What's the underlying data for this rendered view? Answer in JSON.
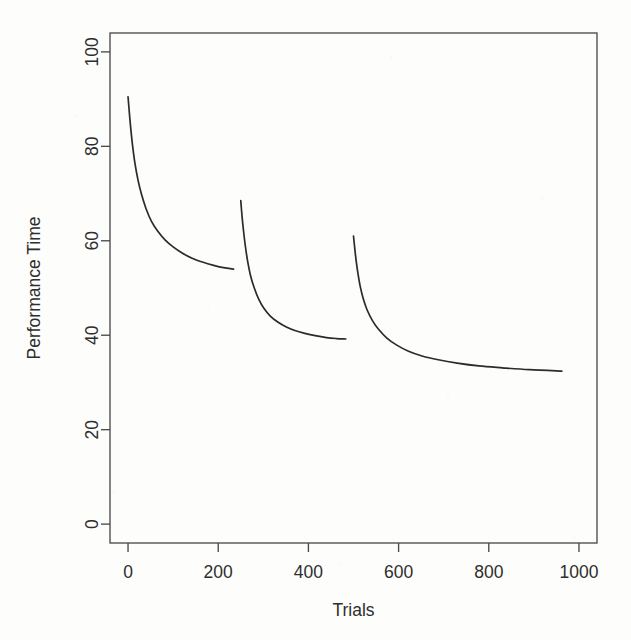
{
  "figure": {
    "kind": "line-plot",
    "background_color": "#fdfdfc",
    "line_color": "#2b2b2b",
    "axis_color": "#4a4a4a",
    "text_color": "#2e2e2e",
    "plot_box": {
      "left": 110,
      "top": 33,
      "right": 597,
      "bottom": 543
    }
  },
  "chart_data": {
    "type": "line",
    "title": "",
    "subtitle": "",
    "xlabel": "Trials",
    "ylabel": "Performance Time",
    "xlim": [
      -40,
      1040
    ],
    "ylim": [
      -4,
      104
    ],
    "xticks": [
      0,
      200,
      400,
      600,
      800,
      1000
    ],
    "xtick_labels": [
      "0",
      "200",
      "400",
      "600",
      "800",
      "1000"
    ],
    "yticks": [
      0,
      20,
      40,
      60,
      80,
      100
    ],
    "ytick_labels": [
      "0",
      "20",
      "40",
      "60",
      "80",
      "100"
    ],
    "grid": false,
    "legend": null,
    "legend_position": "none",
    "annotations": [],
    "ylabel_rotation_deg": -90,
    "ytick_label_rotation_deg": -90,
    "series": [
      {
        "name": "Practice block 1",
        "x": [
          0,
          3,
          6,
          10,
          15,
          22,
          30,
          40,
          52,
          66,
          82,
          100,
          120,
          142,
          165,
          190,
          212,
          234
        ],
        "y": [
          90.5,
          87.0,
          83.8,
          80.2,
          76.6,
          72.9,
          69.8,
          66.8,
          64.1,
          62.0,
          60.2,
          58.7,
          57.4,
          56.3,
          55.5,
          54.8,
          54.3,
          54.0
        ]
      },
      {
        "name": "Practice block 2",
        "x": [
          250,
          253,
          256,
          260,
          265,
          272,
          280,
          290,
          302,
          316,
          332,
          350,
          370,
          392,
          415,
          440,
          462,
          483
        ],
        "y": [
          68.5,
          65.0,
          62.2,
          59.0,
          55.8,
          52.5,
          50.0,
          47.6,
          45.6,
          44.0,
          42.8,
          41.8,
          41.0,
          40.4,
          39.9,
          39.5,
          39.3,
          39.2
        ]
      },
      {
        "name": "Practice block 3",
        "x": [
          500,
          503,
          506,
          510,
          515,
          522,
          530,
          542,
          556,
          574,
          596,
          622,
          652,
          688,
          730,
          778,
          830,
          890,
          962
        ],
        "y": [
          61.0,
          58.2,
          55.7,
          53.0,
          50.3,
          47.6,
          45.4,
          43.1,
          41.2,
          39.4,
          37.9,
          36.6,
          35.6,
          34.8,
          34.1,
          33.5,
          33.1,
          32.7,
          32.4
        ]
      }
    ]
  }
}
